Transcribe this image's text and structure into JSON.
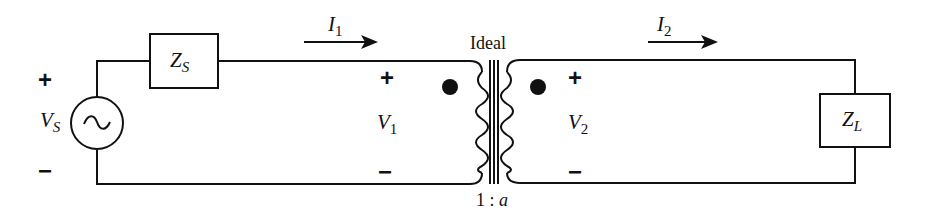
{
  "diagram": {
    "type": "circuit",
    "source": {
      "label": "V",
      "subscript": "S",
      "plus": "+",
      "minus": "−",
      "symbol": "ac-source"
    },
    "source_impedance": {
      "label": "Z",
      "subscript": "S"
    },
    "load_impedance": {
      "label": "Z",
      "subscript": "L"
    },
    "primary_current": {
      "label": "I",
      "subscript": "1"
    },
    "secondary_current": {
      "label": "I",
      "subscript": "2"
    },
    "primary_voltage": {
      "label": "V",
      "subscript": "1",
      "plus": "+",
      "minus": "−"
    },
    "secondary_voltage": {
      "label": "V",
      "subscript": "2",
      "plus": "+",
      "minus": "−"
    },
    "transformer": {
      "label": "Ideal",
      "ratio_prefix": "1 : ",
      "ratio_var": "a"
    },
    "colors": {
      "line": "#111111",
      "background": "#ffffff"
    }
  }
}
